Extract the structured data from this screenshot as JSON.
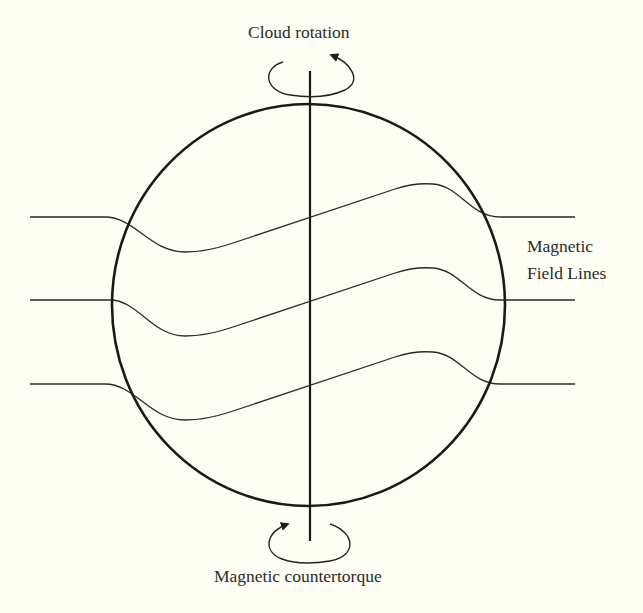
{
  "diagram": {
    "labels": {
      "top": "Cloud rotation",
      "bottom": "Magnetic countertorque",
      "right_line1": "Magnetic",
      "right_line2": "Field Lines"
    },
    "colors": {
      "background": "#fefef4",
      "stroke": "#1e1e1e",
      "text": "#2b2b2b"
    },
    "elements": {
      "cloud": {
        "shape": "ellipse",
        "cx": 308.5,
        "cy": 305,
        "rx": 196.5,
        "ry": 201
      },
      "rotation_axis": {
        "x": 310,
        "y_top": 71,
        "y_bottom": 541
      },
      "top_rotation_arrow": {
        "cx": 312,
        "cy": 78,
        "rx": 43,
        "ry": 17,
        "direction": "counterclockwise-viewed-from-above"
      },
      "bottom_countertorque_arrow": {
        "cx": 308,
        "cy": 544,
        "rx": 42,
        "ry": 19,
        "direction": "opposite"
      },
      "field_lines": [
        {
          "name": "upper",
          "y_outside": 217,
          "valley_y": 252,
          "peak_y": 184
        },
        {
          "name": "middle",
          "y_outside": 300,
          "valley_y": 336,
          "peak_y": 268
        },
        {
          "name": "lower",
          "y_outside": 384,
          "valley_y": 420,
          "peak_y": 352
        }
      ]
    }
  }
}
